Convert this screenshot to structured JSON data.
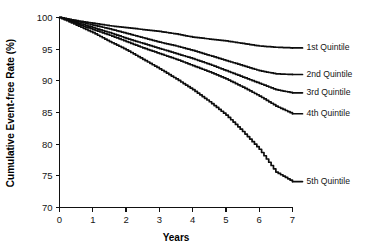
{
  "figure": {
    "background_color": "#ffffff",
    "line_color": "#0d0d0d",
    "text_color": "#151515"
  },
  "chart_data": {
    "type": "line",
    "title": "",
    "subtitle": "",
    "xlabel": "Years",
    "ylabel": "Cumulative Event-free Rate (%)",
    "xlim": [
      0,
      7
    ],
    "ylim": [
      70,
      100
    ],
    "xticks": [
      0,
      1,
      2,
      3,
      4,
      5,
      6,
      7
    ],
    "yticks": [
      70,
      75,
      80,
      85,
      90,
      95,
      100
    ],
    "xtick_labels": [
      "0",
      "1",
      "2",
      "3",
      "4",
      "5",
      "6",
      "7"
    ],
    "ytick_labels": [
      "70",
      "75",
      "80",
      "85",
      "90",
      "95",
      "100"
    ],
    "grid": false,
    "legend_position": "inline-right",
    "x": [
      0,
      0.5,
      1,
      1.5,
      2,
      2.5,
      3,
      3.5,
      4,
      4.5,
      5,
      5.5,
      6,
      6.5,
      7
    ],
    "series": [
      {
        "name": "1st Quintile",
        "label": "1st Quintile",
        "end_value": 95.2,
        "values": [
          100,
          99.5,
          99.1,
          98.7,
          98.4,
          98.1,
          97.8,
          97.4,
          96.9,
          96.6,
          96.3,
          95.9,
          95.5,
          95.3,
          95.2
        ]
      },
      {
        "name": "2nd Quintile",
        "label": "2nd Quintile",
        "end_value": 91.0,
        "values": [
          100,
          99.4,
          98.8,
          98.2,
          97.5,
          96.8,
          96.1,
          95.5,
          94.8,
          94.0,
          93.2,
          92.4,
          91.6,
          91.1,
          91.0
        ]
      },
      {
        "name": "3rd Quintile",
        "label": "3rd Quintile",
        "end_value": 88.1,
        "values": [
          100,
          99.2,
          98.4,
          97.6,
          96.7,
          95.9,
          95.1,
          94.3,
          93.5,
          92.6,
          91.6,
          90.6,
          89.6,
          88.6,
          88.1
        ]
      },
      {
        "name": "4th Quintile",
        "label": "4th Quintile",
        "end_value": 84.8,
        "values": [
          100,
          99.0,
          98.1,
          97.2,
          96.2,
          95.2,
          94.3,
          93.4,
          92.4,
          91.4,
          90.3,
          89.0,
          87.6,
          86.0,
          84.8
        ]
      },
      {
        "name": "5th Quintile",
        "label": "5th Quintile",
        "end_value": 74.1,
        "values": [
          100,
          98.8,
          97.6,
          96.2,
          94.9,
          93.4,
          91.9,
          90.3,
          88.6,
          86.7,
          84.6,
          82.0,
          79.2,
          75.6,
          74.1
        ]
      }
    ]
  }
}
